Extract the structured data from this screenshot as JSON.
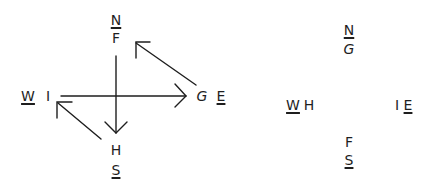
{
  "left_diagram": {
    "compass": {
      "north": "N",
      "south": "S",
      "west": "W",
      "east": "E"
    },
    "nodes": {
      "top": "F",
      "bottom": "H",
      "left": "I",
      "right": "G"
    },
    "arrows": [
      {
        "from": "F",
        "to": "H",
        "direction": "down"
      },
      {
        "from": "I",
        "to": "G",
        "direction": "right"
      },
      {
        "from": "G",
        "to": "F",
        "direction": "up-left"
      },
      {
        "from": "H",
        "to": "I",
        "direction": "up-left"
      }
    ]
  },
  "right_diagram": {
    "compass": {
      "north": "N",
      "south": "S",
      "west": "W",
      "east": "E"
    },
    "nodes": {
      "top": "G",
      "bottom": "F",
      "left": "H",
      "right": "I"
    }
  }
}
